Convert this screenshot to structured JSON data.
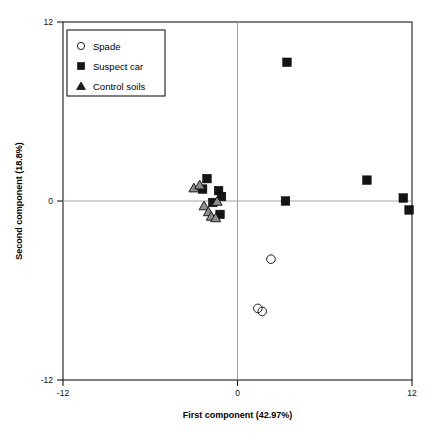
{
  "chart_data": {
    "type": "scatter",
    "title": "",
    "xlabel": "First component (42.97%)",
    "ylabel": "Second component (18.8%)",
    "xlim": [
      -12,
      12
    ],
    "ylim": [
      -12,
      12
    ],
    "xticks": [
      "-12",
      "0",
      "12"
    ],
    "yticks": [
      "12",
      "0",
      "-12"
    ],
    "xtick_values": [
      -12,
      0,
      12
    ],
    "ytick_values": [
      12,
      0,
      -12
    ],
    "grid": "zero-lines-only",
    "legend_position": "top-left",
    "series": [
      {
        "name": "Spade",
        "marker": "open-circle",
        "color": "#1d1d1d",
        "points": [
          {
            "x": 2.3,
            "y": -3.9
          },
          {
            "x": 1.4,
            "y": -7.2
          },
          {
            "x": 1.7,
            "y": -7.4
          }
        ]
      },
      {
        "name": "Suspect car",
        "marker": "filled-square",
        "color": "#141414",
        "points": [
          {
            "x": 3.4,
            "y": 9.3
          },
          {
            "x": -2.1,
            "y": 1.5
          },
          {
            "x": -2.4,
            "y": 0.8
          },
          {
            "x": -1.3,
            "y": 0.7
          },
          {
            "x": -1.1,
            "y": 0.3
          },
          {
            "x": -1.7,
            "y": -0.1
          },
          {
            "x": -1.2,
            "y": -0.9
          },
          {
            "x": 3.3,
            "y": 0.0
          },
          {
            "x": 8.9,
            "y": 1.4
          },
          {
            "x": 11.4,
            "y": 0.2
          },
          {
            "x": 11.8,
            "y": -0.6
          }
        ]
      },
      {
        "name": "Control soils",
        "marker": "filled-triangle",
        "color": "#8e8e8e",
        "points": [
          {
            "x": -3.0,
            "y": 0.9
          },
          {
            "x": -2.6,
            "y": 1.1
          },
          {
            "x": -1.4,
            "y": 0.0
          },
          {
            "x": -2.3,
            "y": -0.3
          },
          {
            "x": -2.0,
            "y": -0.7
          },
          {
            "x": -1.8,
            "y": -1.0
          },
          {
            "x": -1.5,
            "y": -1.1
          }
        ]
      }
    ]
  },
  "legend": {
    "items": [
      {
        "label": "Spade"
      },
      {
        "label": "Suspect car"
      },
      {
        "label": "Control soils"
      }
    ]
  }
}
